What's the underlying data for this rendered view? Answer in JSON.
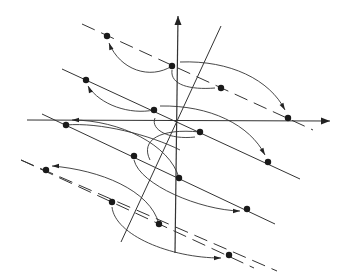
{
  "colors": {
    "ink": "#222222",
    "background": "#ffffff"
  },
  "axes": {
    "x_axis": {
      "from": [
        27,
        120
      ],
      "to": [
        330,
        121
      ]
    },
    "y_axis": {
      "from": [
        175,
        253
      ],
      "to": [
        178,
        16
      ]
    },
    "origin": [
      177,
      121
    ]
  },
  "oblique_line": {
    "from": [
      121,
      242
    ],
    "to": [
      221,
      26
    ]
  },
  "parallel_lines": [
    {
      "style": "dashed",
      "from": [
        82,
        24
      ],
      "to": [
        313,
        130
      ]
    },
    {
      "style": "solid",
      "from": [
        62,
        69
      ],
      "to": [
        300,
        179
      ]
    },
    {
      "style": "solid",
      "from": [
        42,
        114
      ],
      "to": [
        275,
        224
      ]
    },
    {
      "style": "dashed",
      "from": [
        21,
        160
      ],
      "to": [
        277,
        271
      ]
    },
    {
      "style": "dashed",
      "from": [
        21,
        160
      ],
      "to": [
        254,
        268
      ]
    }
  ],
  "points": [
    [
      107,
      36
    ],
    [
      172,
      66
    ],
    [
      221,
      88
    ],
    [
      288,
      118
    ],
    [
      86,
      80
    ],
    [
      154,
      110
    ],
    [
      200,
      132
    ],
    [
      268,
      162
    ],
    [
      66,
      125
    ],
    [
      134,
      156
    ],
    [
      179,
      178
    ],
    [
      247,
      209
    ],
    [
      46,
      170
    ],
    [
      112,
      202
    ],
    [
      159,
      224
    ],
    [
      229,
      255
    ]
  ],
  "curves": [
    {
      "d": "M 172 66 C 150 80, 120 70, 109 43",
      "arrow_at": [
        109,
        43
      ],
      "arrow_dir": -110
    },
    {
      "d": "M 180 62 C 230 60, 270 80, 285 110",
      "arrow_at": [
        285,
        110
      ],
      "arrow_dir": 60
    },
    {
      "d": "M 215 88 C 190 90, 170 85, 172 70",
      "arrow_at": null,
      "arrow_dir": 0
    },
    {
      "d": "M 154 110 C 130 115, 100 105, 88 86",
      "arrow_at": [
        88,
        86
      ],
      "arrow_dir": -115
    },
    {
      "d": "M 160 106 C 210 105, 250 125, 265 155",
      "arrow_at": [
        265,
        155
      ],
      "arrow_dir": 60
    },
    {
      "d": "M 195 137 C 170 140, 150 130, 155 118",
      "arrow_at": null,
      "arrow_dir": 0
    },
    {
      "d": "M 179 178 C 170 145, 120 120, 72 120",
      "arrow_at": [
        72,
        120
      ],
      "arrow_dir": 180
    },
    {
      "d": "M 134 160 C 140 185, 200 210, 240 211",
      "arrow_at": [
        240,
        211
      ],
      "arrow_dir": 0
    },
    {
      "d": "M 159 224 C 150 190, 100 170, 52 166",
      "arrow_at": [
        52,
        166
      ],
      "arrow_dir": 180
    },
    {
      "d": "M 112 207 C 115 235, 170 258, 221 258",
      "arrow_at": [
        221,
        258
      ],
      "arrow_dir": 0
    },
    {
      "d": "M 66 125 C 100 122, 150 135, 180 150",
      "arrow_at": null,
      "arrow_dir": 0
    },
    {
      "d": "M 200 132 C 160 128, 140 140, 150 160",
      "arrow_at": null,
      "arrow_dir": 0
    }
  ]
}
